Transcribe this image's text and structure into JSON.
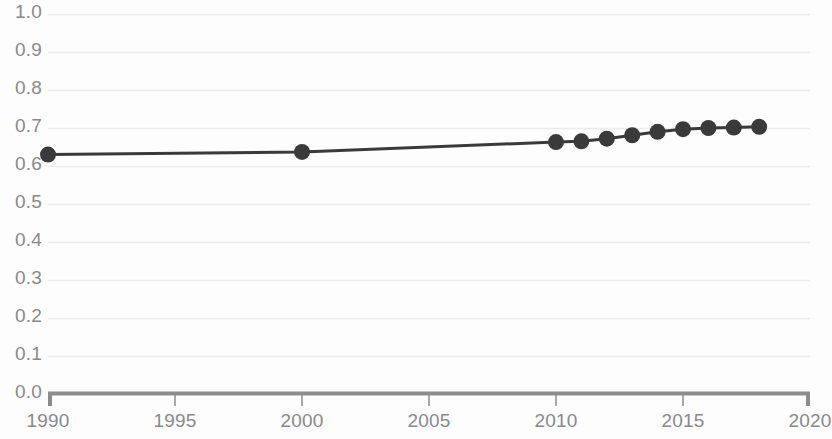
{
  "chart_data": {
    "type": "line",
    "title": "",
    "subtitle": "",
    "xlabel": "",
    "ylabel": "",
    "xlim": [
      1990,
      2020
    ],
    "ylim": [
      0.0,
      1.0
    ],
    "grid": true,
    "grid_axis": "y",
    "legend": false,
    "legend_position": "none",
    "markers": true,
    "marker_shape": "circle",
    "x_ticks": [
      1990,
      1995,
      2000,
      2005,
      2010,
      2015,
      2020
    ],
    "x_tick_labels": [
      "1990",
      "1995",
      "2000",
      "2005",
      "2010",
      "2015",
      "2020"
    ],
    "y_ticks": [
      0.0,
      0.1,
      0.2,
      0.3,
      0.4,
      0.5,
      0.6,
      0.7,
      0.8,
      0.9,
      1.0
    ],
    "y_tick_labels": [
      "0.0",
      "0.1",
      "0.2",
      "0.3",
      "0.4",
      "0.5",
      "0.6",
      "0.7",
      "0.8",
      "0.9",
      "1.0"
    ],
    "series": [
      {
        "name": "series-1",
        "color": "#3a3a3a",
        "x": [
          1990,
          2000,
          2010,
          2011,
          2012,
          2013,
          2014,
          2015,
          2016,
          2017,
          2018
        ],
        "values": [
          0.63,
          0.637,
          0.663,
          0.665,
          0.672,
          0.681,
          0.69,
          0.697,
          0.7,
          0.701,
          0.703
        ]
      }
    ],
    "annotations": []
  },
  "style": {
    "line_color": "#3a3a3a",
    "marker_color": "#3a3a3a",
    "grid_color": "#ececec",
    "axis_color": "#8c8c8c",
    "tick_label_color": "#8a8a8a",
    "background_color": "#fdfdfd"
  }
}
